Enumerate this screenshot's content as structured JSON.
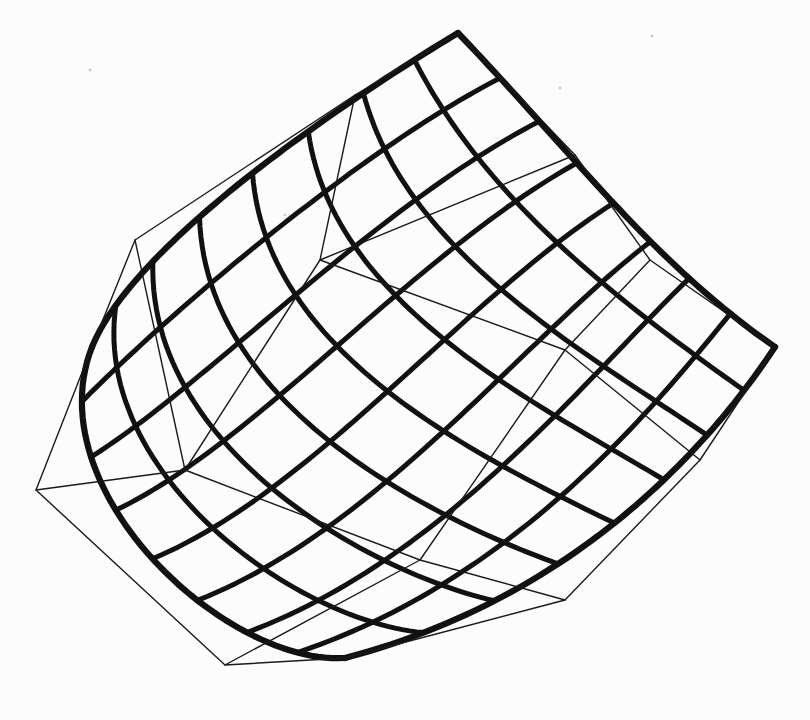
{
  "figure": {
    "type": "bezier-patch-wireframe",
    "canvas": {
      "width": 810,
      "height": 720,
      "background": "#fcfcfc"
    },
    "ink_color": "#111111",
    "net_color": "#1a1a1a",
    "surface_stroke_width": 5.0,
    "boundary_stroke_width": 6.2,
    "net_stroke_width": 1.4,
    "u_isolines": 9,
    "v_isolines": 9,
    "curve_samples": 56,
    "control_net_rows": [
      [
        [
          92,
          347
        ],
        [
          36,
          490
        ],
        [
          225,
          665
        ],
        [
          345,
          658
        ]
      ],
      [
        [
          135,
          240
        ],
        [
          185,
          470
        ],
        [
          420,
          560
        ],
        [
          565,
          600
        ]
      ],
      [
        [
          355,
          95
        ],
        [
          320,
          260
        ],
        [
          565,
          350
        ],
        [
          700,
          460
        ]
      ],
      [
        [
          458,
          33
        ],
        [
          575,
          155
        ],
        [
          650,
          260
        ],
        [
          775,
          347
        ]
      ]
    ],
    "scan_specks": {
      "color": "#c9c9c9",
      "radius": 1.4,
      "points": [
        [
          90,
          70
        ],
        [
          285,
          215
        ],
        [
          560,
          88
        ],
        [
          652,
          36
        ]
      ]
    }
  }
}
